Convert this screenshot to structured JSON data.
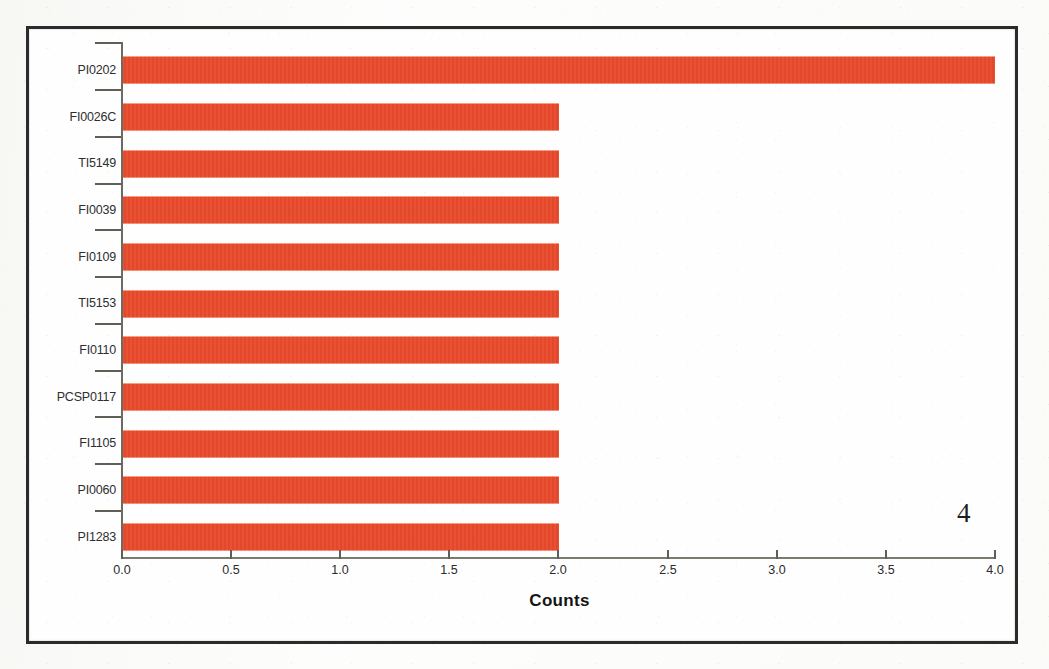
{
  "chart_data": {
    "type": "bar",
    "orientation": "horizontal",
    "title": "",
    "subtitle": "",
    "xlabel": "Counts",
    "ylabel": "",
    "xlim": [
      0.0,
      4.0
    ],
    "xticks": [
      "0.0",
      "0.5",
      "1.0",
      "1.5",
      "2.0",
      "2.5",
      "3.0",
      "3.5",
      "4.0"
    ],
    "xtick_values": [
      0.0,
      0.5,
      1.0,
      1.5,
      2.0,
      2.5,
      3.0,
      3.5,
      4.0
    ],
    "grid": false,
    "legend": false,
    "legend_position": "none",
    "bar_color": "#e8492b",
    "categories": [
      "PI0202",
      "FI0026C",
      "TI5149",
      "FI0039",
      "FI0109",
      "TI5153",
      "FI0110",
      "PCSP0117",
      "FI1105",
      "PI0060",
      "PI1283"
    ],
    "values": [
      4,
      2,
      2,
      2,
      2,
      2,
      2,
      2,
      2,
      2,
      2
    ],
    "annotations": [
      {
        "text": "4",
        "x": 3.82,
        "y": "PI1283",
        "position": "bottom-right-of-plot"
      }
    ]
  },
  "figure": {
    "axis_title": "Counts",
    "annotation_label": "4",
    "frame_color": "#2b2b2b",
    "background_color": "#fefefe",
    "axis_line_color": "#6b6b63",
    "tick_label_color": "#2b2b2b"
  }
}
